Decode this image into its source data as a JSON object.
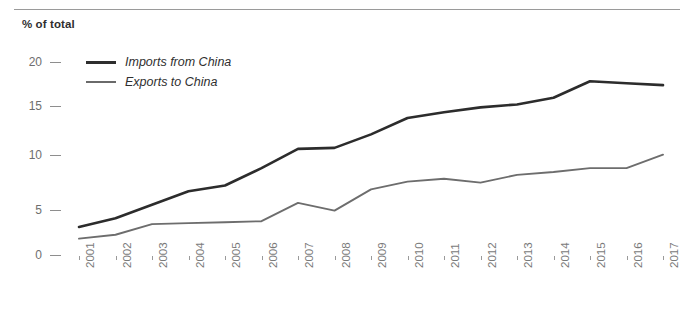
{
  "header": {
    "axis_title": "% of total"
  },
  "legend": {
    "position": "top-left",
    "entries": [
      {
        "label": "Imports from China",
        "color": "#2c2c2c",
        "swatch": "line-swatch-imports"
      },
      {
        "label": "Exports to China",
        "color": "#6d6d6d",
        "swatch": "line-swatch-exports"
      }
    ]
  },
  "axes": {
    "y_ticks": [
      "20",
      "15",
      "10",
      "5",
      "0"
    ],
    "x_ticks": [
      "2001",
      "2002",
      "2003",
      "2004",
      "2005",
      "2006",
      "2007",
      "2008",
      "2009",
      "2010",
      "2011",
      "2012",
      "2013",
      "2014",
      "2015",
      "2016",
      "2017"
    ]
  },
  "chart_data": {
    "type": "line",
    "title": "",
    "subtitle": "",
    "xlabel": "",
    "ylabel": "% of total",
    "ylim": [
      0,
      20
    ],
    "xlim": [
      "2001",
      "2017"
    ],
    "grid": false,
    "legend_position": "top-left",
    "categories": [
      "2001",
      "2002",
      "2003",
      "2004",
      "2005",
      "2006",
      "2007",
      "2008",
      "2009",
      "2010",
      "2011",
      "2012",
      "2013",
      "2014",
      "2015",
      "2016",
      "2017"
    ],
    "series": [
      {
        "name": "Imports from China",
        "color": "#2c2c2c",
        "values": [
          2.9,
          3.8,
          5.2,
          6.6,
          7.2,
          9.0,
          11.0,
          11.1,
          12.5,
          14.2,
          14.8,
          15.3,
          15.6,
          16.3,
          18.0,
          17.8,
          17.6
        ]
      },
      {
        "name": "Exports to China",
        "color": "#6d6d6d",
        "values": [
          1.7,
          2.1,
          3.2,
          3.3,
          3.4,
          3.5,
          5.4,
          4.6,
          6.8,
          7.6,
          7.9,
          7.5,
          8.3,
          8.6,
          9.0,
          9.0,
          10.4
        ]
      }
    ]
  }
}
